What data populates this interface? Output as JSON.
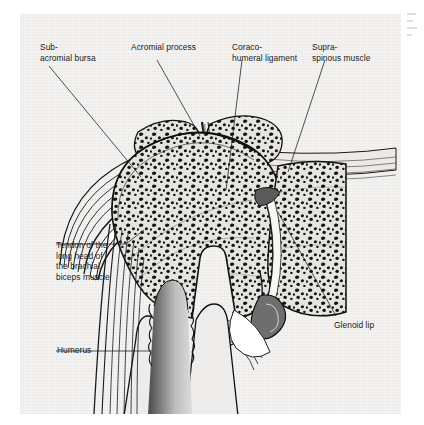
{
  "figure": {
    "kind": "anatomical-illustration",
    "style": "black-and-white line drawing with stippled trabecular bone",
    "background_color": "#f4f3f1",
    "ink_color": "#1a1a1a"
  },
  "labels": [
    {
      "id": "subacromial-bursa",
      "lines": [
        "Sub-",
        "acromial bursa"
      ],
      "text": "Sub-\nacromial bursa",
      "x": 40,
      "y": 42
    },
    {
      "id": "acromial-process",
      "lines": [
        "Acromial process"
      ],
      "text": "Acromial process",
      "x": 131,
      "y": 42
    },
    {
      "id": "coracohumeral-ligament",
      "lines": [
        "Coraco-",
        "humeral ligament"
      ],
      "text": "Coraco-\nhumeral ligament",
      "x": 232,
      "y": 42
    },
    {
      "id": "supraspinous-muscle",
      "lines": [
        "Supra-",
        "spinous muscle"
      ],
      "text": "Supra-\nspinous muscle",
      "x": 312,
      "y": 42
    },
    {
      "id": "biceps-tendon",
      "lines": [
        "Tendon of the",
        "long head of",
        "the brachial",
        "biceps muscle"
      ],
      "text": "Tendon of the\nlong head of\nthe brachial\nbiceps muscle",
      "x": 56,
      "y": 240
    },
    {
      "id": "glenoid-lip",
      "lines": [
        "Glenoid lip"
      ],
      "text": "Glenoid lip",
      "x": 334,
      "y": 320
    },
    {
      "id": "humerus",
      "lines": [
        "Humerus"
      ],
      "text": "Humerus",
      "x": 57,
      "y": 345
    }
  ],
  "structures": [
    "acromion",
    "humeral head",
    "humeral shaft",
    "medullary cavity",
    "glenoid of scapula",
    "glenoid labrum",
    "joint capsule",
    "subacromial bursa",
    "supraspinatus tendon",
    "biceps long head tendon"
  ]
}
